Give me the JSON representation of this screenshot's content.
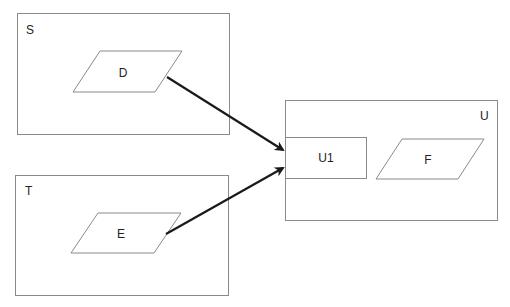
{
  "diagram": {
    "containers": [
      {
        "id": "S",
        "label": "S",
        "x": 17,
        "y": 13,
        "w": 212,
        "h": 121
      },
      {
        "id": "T",
        "label": "T",
        "x": 15,
        "y": 175,
        "w": 213,
        "h": 120
      },
      {
        "id": "U",
        "label": "U",
        "x": 285,
        "y": 100,
        "w": 212,
        "h": 120
      }
    ],
    "nodes": [
      {
        "id": "D",
        "label": "D",
        "shape": "parallelogram",
        "parent": "S"
      },
      {
        "id": "E",
        "label": "E",
        "shape": "parallelogram",
        "parent": "T"
      },
      {
        "id": "U1",
        "label": "U1",
        "shape": "rectangle",
        "parent": "U"
      },
      {
        "id": "F",
        "label": "F",
        "shape": "parallelogram",
        "parent": "U"
      }
    ],
    "edges": [
      {
        "from": "D",
        "to": "U1",
        "style": "arrow"
      },
      {
        "from": "E",
        "to": "U1",
        "style": "arrow"
      }
    ],
    "colors": {
      "stroke": "#8a8a8a",
      "arrow": "#1a1a1a",
      "text": "#222222"
    }
  }
}
